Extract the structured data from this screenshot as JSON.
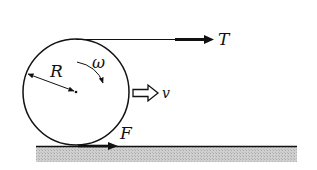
{
  "diagram": {
    "labels": {
      "tension": "T",
      "friction": "F",
      "velocity": "v",
      "radius": "R",
      "angular_velocity": "ω"
    },
    "colors": {
      "stroke": "#111111",
      "ground_fill": "#c8c8c8",
      "background": "#ffffff"
    },
    "geometry": {
      "circle": {
        "cx": 76,
        "cy": 92,
        "r": 53
      },
      "ground_y": 146,
      "tension_line_y": 39
    }
  }
}
